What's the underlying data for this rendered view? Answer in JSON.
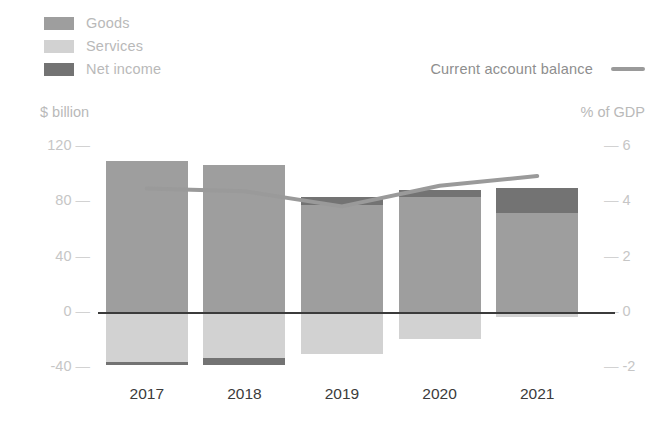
{
  "legend": {
    "items": [
      {
        "label": "Goods",
        "color": "#9e9e9e",
        "key": "goods"
      },
      {
        "label": "Services",
        "color": "#d2d2d2",
        "key": "services"
      },
      {
        "label": "Net income",
        "color": "#737373",
        "key": "net_income"
      }
    ],
    "line_item": {
      "label": "Current account balance",
      "color": "#9a9a9a"
    }
  },
  "axes": {
    "left_title": "$ billion",
    "right_title": "% of GDP",
    "left_ticks": [
      "120",
      "80",
      "40",
      "0",
      "-40"
    ],
    "right_ticks": [
      "6",
      "4",
      "2",
      "0",
      "-2"
    ],
    "tick_dash": "—"
  },
  "chart_data": {
    "type": "bar",
    "title": "",
    "xlabel": "",
    "ylabel": "$ billion",
    "y2label": "% of GDP",
    "categories": [
      "2017",
      "2018",
      "2019",
      "2020",
      "2021"
    ],
    "ylim": [
      -40,
      120
    ],
    "y2lim": [
      -2,
      6
    ],
    "grid": false,
    "legend_position": "top-left",
    "stacked": true,
    "series": [
      {
        "name": "Goods",
        "color": "#9e9e9e",
        "values": [
          110,
          107,
          78,
          84,
          72
        ]
      },
      {
        "name": "Services",
        "color": "#d2d2d2",
        "values": [
          -36,
          -33,
          -30,
          -19,
          -3
        ]
      },
      {
        "name": "Net income",
        "color": "#737373",
        "values": [
          -2,
          -5,
          6,
          5,
          18
        ]
      }
    ],
    "line_series": {
      "name": "Current account balance",
      "color": "#9a9a9a",
      "axis": "right",
      "unit": "% of GDP",
      "values": [
        4.5,
        4.4,
        3.85,
        4.6,
        4.95
      ]
    }
  }
}
